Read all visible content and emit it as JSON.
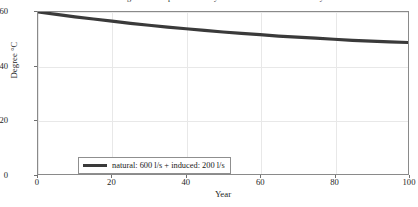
{
  "chart_data": {
    "type": "line",
    "title": "Prediction of gradual temperature decay at elevation 660 m after 100 years",
    "xlabel": "Year",
    "ylabel": "Degree °C",
    "xlim": [
      0,
      100
    ],
    "ylim": [
      0,
      60
    ],
    "xticks": [
      "0",
      "20",
      "40",
      "60",
      "80",
      "100"
    ],
    "yticks": [
      "0",
      "20",
      "40",
      "60"
    ],
    "xtick_values": [
      0,
      20,
      40,
      60,
      80,
      100
    ],
    "ytick_values": [
      0,
      20,
      40,
      60
    ],
    "grid": true,
    "legend_position": "lower-left-inside",
    "series": [
      {
        "name": "natural: 600 l/s + induced: 200 l/s",
        "color": "#3a3a3a",
        "x": [
          0,
          5,
          10,
          15,
          20,
          25,
          30,
          35,
          40,
          45,
          50,
          55,
          60,
          65,
          70,
          75,
          80,
          85,
          90,
          95,
          100
        ],
        "values": [
          60.0,
          59.1,
          58.2,
          57.4,
          56.6,
          55.8,
          55.1,
          54.4,
          53.8,
          53.2,
          52.6,
          52.1,
          51.6,
          51.1,
          50.7,
          50.3,
          49.9,
          49.5,
          49.2,
          48.9,
          48.7
        ]
      }
    ]
  },
  "legend": {
    "entries": [
      {
        "label": "natural: 600 l/s + induced: 200 l/s",
        "color": "#3a3a3a"
      }
    ]
  },
  "colors": {
    "line": "#3a3a3a",
    "grid": "#e8e8e8",
    "axis": "#8a8a8a",
    "text": "#1d1d1d",
    "background": "#ffffff"
  }
}
